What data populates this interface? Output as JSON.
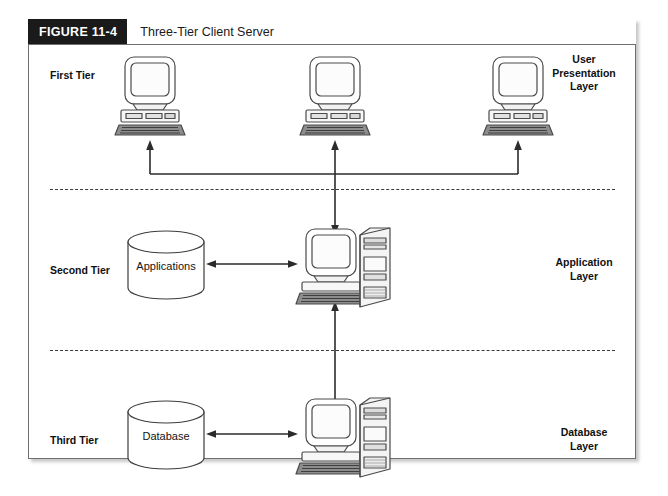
{
  "figure": {
    "tag": "FIGURE 11-4",
    "title": "Three-Tier Client Server"
  },
  "tiers": [
    {
      "id": "first",
      "left_label": "First Tier",
      "right_label": "User\nPresentation\nLayer",
      "right_label_lines": [
        "User",
        "Presentation",
        "Layer"
      ],
      "nodes": [
        "client-workstation",
        "client-workstation",
        "client-workstation"
      ]
    },
    {
      "id": "second",
      "left_label": "Second Tier",
      "right_label": "Application\nLayer",
      "right_label_lines": [
        "Application",
        "Layer"
      ],
      "store_label": "Applications",
      "nodes": [
        "application-server"
      ]
    },
    {
      "id": "third",
      "left_label": "Third Tier",
      "right_label": "Database\nLayer",
      "right_label_lines": [
        "Database",
        "Layer"
      ],
      "store_label": "Database",
      "nodes": [
        "database-server"
      ]
    }
  ],
  "colors": {
    "tag_background": "#1a1a1a",
    "tag_text": "#ffffff",
    "frame_border": "#6f6f6f",
    "line": "#2b2b2b",
    "divider": "#3a3a3a",
    "text": "#101010",
    "device_fill": "#ffffff",
    "device_stroke": "#4a4a4a",
    "screen_fill": "#fbfbfb",
    "keyboard_fill": "#8d8d8d"
  },
  "connections": [
    {
      "name": "tier1-bus-to-left-client",
      "type": "arrow-up"
    },
    {
      "name": "tier1-bus-to-center-client",
      "type": "arrow-up"
    },
    {
      "name": "tier1-bus-to-right-client",
      "type": "arrow-up"
    },
    {
      "name": "tier1-to-tier2-trunk",
      "type": "arrow-down"
    },
    {
      "name": "applications-store-to-app-server",
      "type": "double-arrow"
    },
    {
      "name": "tier2-to-tier3",
      "type": "double-arrow-vertical"
    },
    {
      "name": "database-store-to-db-server",
      "type": "double-arrow"
    }
  ]
}
